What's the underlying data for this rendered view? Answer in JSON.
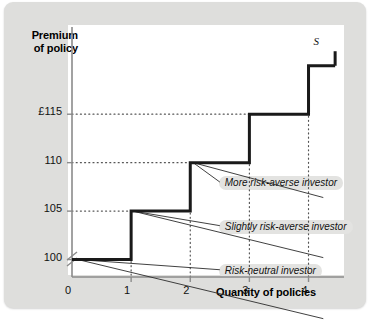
{
  "figure": {
    "background_color": "#dededc",
    "panel_color": "#ffffff",
    "curve_color": "#1a1a1a",
    "annotation_pill_color": "#e3e3e1"
  },
  "chart_data": {
    "type": "line",
    "title": "",
    "subtitle": "",
    "xlabel": "Quantity of policies",
    "ylabel": "Premium of policy",
    "grid": true,
    "grid_style": "dotted",
    "legend_position": "inline-annotations",
    "axis_break_y": true,
    "xlim": [
      0,
      4.6
    ],
    "ylim": [
      98.2,
      124
    ],
    "xticks": [
      0,
      1,
      2,
      3,
      4
    ],
    "xtick_labels": [
      "0",
      "1",
      "2",
      "3",
      "4"
    ],
    "yticks": [
      100,
      105,
      110,
      115
    ],
    "ytick_labels": [
      "100",
      "105",
      "110",
      "£115"
    ],
    "series": [
      {
        "name": "S",
        "label": "S",
        "type": "step",
        "note": "Supply of insurance: premium steps up with each additional policy",
        "steps": [
          {
            "x_start": 0,
            "x_end": 1,
            "y": 100
          },
          {
            "x_start": 1,
            "x_end": 2,
            "y": 105
          },
          {
            "x_start": 2,
            "x_end": 3,
            "y": 110
          },
          {
            "x_start": 3,
            "x_end": 4,
            "y": 115
          },
          {
            "x_start": 4,
            "x_end": 4.45,
            "y": 120
          }
        ]
      },
      {
        "name": "More risk-averse investor",
        "type": "line",
        "note": "Demand curve of the most risk-averse investor (highest, flattest)",
        "points": [
          {
            "x": 2.05,
            "y": 110
          },
          {
            "x": 4.25,
            "y": 106.4
          }
        ]
      },
      {
        "name": "Slightly risk-averse investor",
        "type": "line",
        "note": "Demand curve of a slightly risk-averse investor (middle)",
        "points": [
          {
            "x": 1.03,
            "y": 105
          },
          {
            "x": 4.25,
            "y": 100.2
          }
        ]
      },
      {
        "name": "Risk-neutral investor",
        "type": "line",
        "note": "Demand curve of the risk-neutral investor (lowest)",
        "points": [
          {
            "x": 0.1,
            "y": 100
          },
          {
            "x": 4.25,
            "y": 93.9
          }
        ]
      }
    ],
    "annotations": [
      {
        "text": "More risk-averse investor",
        "x": 2.55,
        "y": 107.7
      },
      {
        "text": "Slightly risk-averse investor",
        "x": 2.55,
        "y": 103.2
      },
      {
        "text": "Risk-neutral investor",
        "x": 2.55,
        "y": 98.6
      }
    ],
    "series_label_marks": [
      {
        "text": "S",
        "x": 4.15,
        "y": 122.1
      }
    ],
    "dotted_guides": {
      "vertical_at_x": [
        1,
        2,
        3,
        4
      ],
      "horizontal_at_y": [
        105,
        110,
        115
      ]
    }
  }
}
